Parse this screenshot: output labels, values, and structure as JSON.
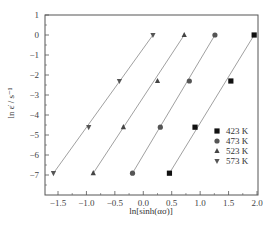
{
  "chart_data": {
    "type": "scatter",
    "title": "",
    "xlabel": "ln[sinh(ασ)]",
    "ylabel": "ln ε̇ / s⁻¹",
    "xlim": [
      -1.75,
      2.0
    ],
    "ylim": [
      -8,
      1
    ],
    "xticks": [
      -1.5,
      -1.0,
      -0.5,
      0.0,
      0.5,
      1.0,
      1.5,
      2.0
    ],
    "xtick_labels": [
      "−1.5",
      "−1.0",
      "−0.5",
      "0.0",
      "0.5",
      "1.0",
      "1.5",
      "2.0"
    ],
    "yticks": [
      1,
      0,
      -1,
      -2,
      -3,
      -4,
      -5,
      -6,
      -7
    ],
    "ytick_labels": [
      "1",
      "0",
      "−1",
      "−2",
      "−3",
      "−4",
      "−5",
      "−6",
      "−7"
    ],
    "grid": false,
    "legend_position": "lower right",
    "fit_lines": true,
    "series": [
      {
        "name": "423 K",
        "marker": "square",
        "x": [
          0.46,
          0.91,
          1.54,
          1.95
        ],
        "y": [
          -6.91,
          -4.61,
          -2.3,
          0.0
        ]
      },
      {
        "name": "473 K",
        "marker": "circle",
        "x": [
          -0.19,
          0.3,
          0.81,
          1.26
        ],
        "y": [
          -6.91,
          -4.61,
          -2.3,
          0.0
        ]
      },
      {
        "name": "523 K",
        "marker": "triangle-up",
        "x": [
          -0.88,
          -0.35,
          0.25,
          0.72
        ],
        "y": [
          -6.91,
          -4.61,
          -2.3,
          0.0
        ]
      },
      {
        "name": "573 K",
        "marker": "triangle-down",
        "x": [
          -1.58,
          -0.96,
          -0.42,
          0.17
        ],
        "y": [
          -6.91,
          -4.61,
          -2.3,
          0.0
        ]
      }
    ]
  },
  "colors": {
    "marker": "#111111",
    "fit_line": "#888888",
    "frame": "#555555"
  }
}
